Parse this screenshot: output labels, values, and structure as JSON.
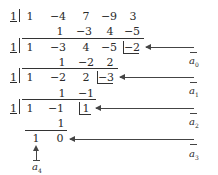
{
  "diagram": {
    "type": "repeated synthetic division (Horner's scheme)",
    "divisor": "1",
    "rows": [
      {
        "name": "coefficients",
        "values": [
          "1",
          "−4",
          "7",
          "−9",
          "3"
        ]
      },
      {
        "name": "products-1",
        "values": [
          "1",
          "−3",
          "4",
          "−5"
        ]
      },
      {
        "name": "quotient-1",
        "values": [
          "1",
          "−3",
          "4",
          "−5"
        ],
        "remainder": "−2"
      },
      {
        "name": "products-2",
        "values": [
          "1",
          "−2",
          "2"
        ]
      },
      {
        "name": "quotient-2",
        "values": [
          "1",
          "−2",
          "2"
        ],
        "remainder": "−3"
      },
      {
        "name": "products-3",
        "values": [
          "1",
          "−1"
        ]
      },
      {
        "name": "quotient-3",
        "values": [
          "1",
          "−1"
        ],
        "remainder": "1"
      },
      {
        "name": "products-4",
        "values": [
          "1"
        ]
      },
      {
        "name": "quotient-4",
        "values": [
          "1"
        ],
        "remainder": "0"
      }
    ],
    "labels": {
      "a0": {
        "letter": "a",
        "sub": "0"
      },
      "a1": {
        "letter": "a",
        "sub": "1"
      },
      "a2": {
        "letter": "a",
        "sub": "2"
      },
      "a3": {
        "letter": "a",
        "sub": "3"
      },
      "a4": {
        "letter": "a",
        "sub": "4"
      }
    }
  }
}
